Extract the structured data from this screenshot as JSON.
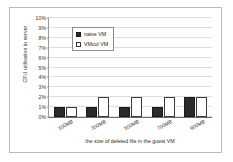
{
  "chart_data": {
    "type": "bar",
    "title": "",
    "xlabel": "the size of deleted file in the guest VM",
    "ylabel": "CPU utilisation in server",
    "categories": [
      "100MB",
      "300MB",
      "500MB",
      "700MB",
      "900MB"
    ],
    "series": [
      {
        "name": "naive VM",
        "values": [
          1,
          1,
          1,
          1,
          2
        ]
      },
      {
        "name": "VMcul VM",
        "values": [
          1,
          2,
          2,
          2,
          2
        ]
      }
    ],
    "ylim": [
      0,
      10
    ],
    "ytick_labels": [
      "0%",
      "1%",
      "2%",
      "3%",
      "4%",
      "5%",
      "6%",
      "7%",
      "8%",
      "9%",
      "10%"
    ],
    "ytick_values": [
      0,
      1,
      2,
      3,
      4,
      5,
      6,
      7,
      8,
      9,
      10
    ],
    "grid": true,
    "legend_position": "upper-left-inside",
    "colors": {
      "series_naive": "#2b2b2b",
      "series_vmcul": "#ffffff",
      "grid": "#dedede",
      "axis": "#6d6d6d",
      "frame": "#b9b9b9",
      "background": "#ffffff"
    }
  }
}
